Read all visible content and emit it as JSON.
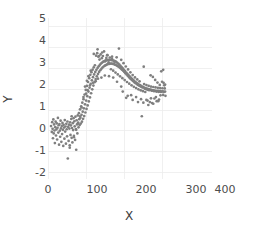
{
  "chart_data": {
    "type": "scatter",
    "title": "",
    "xlabel": "X",
    "ylabel": "Y",
    "xlim": [
      0,
      430
    ],
    "ylim": [
      -2.3,
      5.4
    ],
    "xticks": [
      0,
      100,
      200,
      300,
      400
    ],
    "xticklabels": [
      "0",
      "100",
      "200",
      "300",
      "400"
    ],
    "yticks": [
      -2,
      -1,
      0,
      1,
      2,
      3,
      4,
      5
    ],
    "yticklabels": [
      "-2",
      "-1",
      "0",
      "1",
      "2",
      "3",
      "4",
      "5"
    ],
    "grid": true,
    "grid_color": "#ececec",
    "legend": null,
    "marker_color": "#7f7f7f",
    "marker_size": 2.0,
    "series_name": "observations",
    "points": [
      [
        8,
        0.23
      ],
      [
        10,
        -0.05
      ],
      [
        11,
        0.42
      ],
      [
        12,
        0.1
      ],
      [
        13,
        -0.35
      ],
      [
        14,
        0.55
      ],
      [
        15,
        -0.12
      ],
      [
        16,
        0.31
      ],
      [
        17,
        0.02
      ],
      [
        18,
        -0.58
      ],
      [
        19,
        0.18
      ],
      [
        20,
        0.44
      ],
      [
        21,
        -0.22
      ],
      [
        22,
        0.07
      ],
      [
        23,
        0.36
      ],
      [
        24,
        -0.41
      ],
      [
        25,
        0.15
      ],
      [
        26,
        0.62
      ],
      [
        27,
        -0.08
      ],
      [
        28,
        0.27
      ],
      [
        29,
        -0.66
      ],
      [
        30,
        0.33
      ],
      [
        31,
        0.01
      ],
      [
        32,
        -0.28
      ],
      [
        33,
        0.49
      ],
      [
        34,
        0.12
      ],
      [
        35,
        -0.52
      ],
      [
        36,
        0.24
      ],
      [
        37,
        -0.15
      ],
      [
        38,
        0.38
      ],
      [
        39,
        0.05
      ],
      [
        40,
        -0.72
      ],
      [
        41,
        0.29
      ],
      [
        42,
        0.16
      ],
      [
        43,
        -0.37
      ],
      [
        44,
        0.52
      ],
      [
        45,
        -0.03
      ],
      [
        46,
        0.21
      ],
      [
        47,
        -0.61
      ],
      [
        48,
        0.34
      ],
      [
        49,
        0.08
      ],
      [
        50,
        -0.26
      ],
      [
        51,
        0.45
      ],
      [
        52,
        -1.32
      ],
      [
        53,
        0.19
      ],
      [
        54,
        -0.48
      ],
      [
        55,
        0.3
      ],
      [
        56,
        0.11
      ],
      [
        57,
        -0.69
      ],
      [
        58,
        0.41
      ],
      [
        59,
        -0.19
      ],
      [
        60,
        0.26
      ],
      [
        61,
        0.57
      ],
      [
        62,
        -0.33
      ],
      [
        63,
        0.14
      ],
      [
        64,
        -0.55
      ],
      [
        65,
        0.37
      ],
      [
        66,
        0.04
      ],
      [
        67,
        0.61
      ],
      [
        68,
        -0.24
      ],
      [
        69,
        0.46
      ],
      [
        70,
        0.22
      ],
      [
        71,
        -0.43
      ],
      [
        72,
        0.68
      ],
      [
        73,
        0.09
      ],
      [
        74,
        -0.9
      ],
      [
        75,
        0.51
      ],
      [
        76,
        0.31
      ],
      [
        77,
        -0.12
      ],
      [
        78,
        0.74
      ],
      [
        79,
        0.4
      ],
      [
        80,
        0.17
      ],
      [
        81,
        0.85
      ],
      [
        82,
        0.56
      ],
      [
        83,
        0.28
      ],
      [
        84,
        1.03
      ],
      [
        85,
        0.63
      ],
      [
        86,
        0.35
      ],
      [
        87,
        1.18
      ],
      [
        88,
        0.77
      ],
      [
        89,
        0.44
      ],
      [
        90,
        1.35
      ],
      [
        91,
        0.92
      ],
      [
        92,
        0.58
      ],
      [
        93,
        1.52
      ],
      [
        94,
        1.08
      ],
      [
        95,
        0.71
      ],
      [
        96,
        1.74
      ],
      [
        97,
        1.27
      ],
      [
        98,
        0.88
      ],
      [
        99,
        1.96
      ],
      [
        100,
        1.45
      ],
      [
        101,
        1.05
      ],
      [
        102,
        2.15
      ],
      [
        103,
        1.66
      ],
      [
        104,
        1.22
      ],
      [
        105,
        2.34
      ],
      [
        106,
        1.88
      ],
      [
        107,
        1.41
      ],
      [
        108,
        2.52
      ],
      [
        109,
        2.07
      ],
      [
        110,
        1.6
      ],
      [
        111,
        2.68
      ],
      [
        112,
        2.25
      ],
      [
        113,
        1.8
      ],
      [
        114,
        2.81
      ],
      [
        115,
        2.42
      ],
      [
        116,
        1.99
      ],
      [
        117,
        2.93
      ],
      [
        118,
        2.57
      ],
      [
        119,
        2.17
      ],
      [
        120,
        3.04
      ],
      [
        121,
        2.7
      ],
      [
        122,
        2.33
      ],
      [
        123,
        3.14
      ],
      [
        124,
        2.82
      ],
      [
        125,
        2.48
      ],
      [
        126,
        3.6
      ],
      [
        127,
        2.92
      ],
      [
        128,
        2.61
      ],
      [
        129,
        3.72
      ],
      [
        130,
        3.01
      ],
      [
        131,
        2.72
      ],
      [
        132,
        3.55
      ],
      [
        133,
        3.09
      ],
      [
        134,
        2.82
      ],
      [
        135,
        3.41
      ],
      [
        136,
        3.16
      ],
      [
        137,
        2.9
      ],
      [
        138,
        3.66
      ],
      [
        139,
        3.22
      ],
      [
        140,
        2.97
      ],
      [
        141,
        3.48
      ],
      [
        142,
        3.27
      ],
      [
        143,
        3.03
      ],
      [
        144,
        3.58
      ],
      [
        145,
        3.31
      ],
      [
        146,
        3.08
      ],
      [
        147,
        3.8
      ],
      [
        148,
        3.34
      ],
      [
        149,
        3.12
      ],
      [
        150,
        3.33
      ],
      [
        151,
        3.37
      ],
      [
        152,
        3.15
      ],
      [
        153,
        3.49
      ],
      [
        154,
        3.38
      ],
      [
        155,
        3.18
      ],
      [
        156,
        3.62
      ],
      [
        157,
        3.39
      ],
      [
        158,
        3.2
      ],
      [
        159,
        3.28
      ],
      [
        160,
        3.4
      ],
      [
        161,
        3.21
      ],
      [
        162,
        3.51
      ],
      [
        163,
        3.4
      ],
      [
        164,
        3.22
      ],
      [
        165,
        2.95
      ],
      [
        166,
        3.39
      ],
      [
        167,
        3.22
      ],
      [
        168,
        3.44
      ],
      [
        169,
        3.38
      ],
      [
        170,
        3.21
      ],
      [
        171,
        2.88
      ],
      [
        172,
        3.36
      ],
      [
        173,
        3.19
      ],
      [
        174,
        3.31
      ],
      [
        175,
        3.34
      ],
      [
        176,
        3.17
      ],
      [
        177,
        2.79
      ],
      [
        178,
        3.31
      ],
      [
        179,
        3.14
      ],
      [
        180,
        3.52
      ],
      [
        181,
        3.27
      ],
      [
        182,
        3.11
      ],
      [
        183,
        2.7
      ],
      [
        184,
        3.22
      ],
      [
        185,
        3.07
      ],
      [
        186,
        3.94
      ],
      [
        187,
        3.17
      ],
      [
        188,
        3.03
      ],
      [
        189,
        2.61
      ],
      [
        190,
        3.11
      ],
      [
        191,
        2.98
      ],
      [
        192,
        3.4
      ],
      [
        193,
        3.05
      ],
      [
        194,
        2.93
      ],
      [
        195,
        2.52
      ],
      [
        196,
        2.99
      ],
      [
        197,
        2.88
      ],
      [
        198,
        3.24
      ],
      [
        199,
        2.92
      ],
      [
        200,
        2.82
      ],
      [
        201,
        2.43
      ],
      [
        202,
        2.86
      ],
      [
        203,
        2.76
      ],
      [
        204,
        3.08
      ],
      [
        205,
        2.79
      ],
      [
        206,
        2.7
      ],
      [
        207,
        2.34
      ],
      [
        208,
        2.73
      ],
      [
        209,
        2.64
      ],
      [
        210,
        2.94
      ],
      [
        211,
        2.67
      ],
      [
        212,
        2.58
      ],
      [
        213,
        2.26
      ],
      [
        214,
        2.61
      ],
      [
        215,
        2.52
      ],
      [
        216,
        2.8
      ],
      [
        217,
        2.55
      ],
      [
        218,
        2.47
      ],
      [
        219,
        2.18
      ],
      [
        220,
        2.49
      ],
      [
        221,
        2.42
      ],
      [
        222,
        2.67
      ],
      [
        223,
        2.44
      ],
      [
        224,
        2.37
      ],
      [
        225,
        2.11
      ],
      [
        226,
        2.39
      ],
      [
        227,
        2.32
      ],
      [
        228,
        2.56
      ],
      [
        229,
        2.34
      ],
      [
        230,
        2.28
      ],
      [
        231,
        2.05
      ],
      [
        232,
        2.3
      ],
      [
        233,
        2.24
      ],
      [
        234,
        2.46
      ],
      [
        235,
        2.26
      ],
      [
        236,
        2.2
      ],
      [
        237,
        1.99
      ],
      [
        238,
        2.22
      ],
      [
        239,
        2.17
      ],
      [
        240,
        2.37
      ],
      [
        241,
        2.19
      ],
      [
        242,
        2.14
      ],
      [
        243,
        1.94
      ],
      [
        244,
        2.15
      ],
      [
        245,
        2.1
      ],
      [
        246,
        0.7
      ],
      [
        247,
        2.12
      ],
      [
        248,
        2.08
      ],
      [
        249,
        1.9
      ],
      [
        250,
        2.09
      ],
      [
        251,
        3.07
      ],
      [
        252,
        2.24
      ],
      [
        253,
        2.06
      ],
      [
        254,
        2.02
      ],
      [
        255,
        1.86
      ],
      [
        256,
        2.04
      ],
      [
        257,
        2.0
      ],
      [
        258,
        2.19
      ],
      [
        259,
        2.02
      ],
      [
        260,
        1.98
      ],
      [
        261,
        1.45
      ],
      [
        262,
        2.0
      ],
      [
        263,
        1.96
      ],
      [
        264,
        2.15
      ],
      [
        265,
        1.99
      ],
      [
        266,
        1.95
      ],
      [
        267,
        1.38
      ],
      [
        268,
        1.97
      ],
      [
        269,
        2.66
      ],
      [
        270,
        2.12
      ],
      [
        271,
        1.96
      ],
      [
        272,
        1.92
      ],
      [
        273,
        1.33
      ],
      [
        274,
        1.94
      ],
      [
        275,
        2.58
      ],
      [
        276,
        2.1
      ],
      [
        277,
        1.94
      ],
      [
        278,
        1.9
      ],
      [
        279,
        1.55
      ],
      [
        280,
        1.92
      ],
      [
        281,
        2.44
      ],
      [
        282,
        2.08
      ],
      [
        283,
        1.92
      ],
      [
        284,
        1.88
      ],
      [
        285,
        1.42
      ],
      [
        286,
        1.9
      ],
      [
        287,
        2.31
      ],
      [
        288,
        2.06
      ],
      [
        289,
        1.91
      ],
      [
        290,
        1.87
      ],
      [
        291,
        1.5
      ],
      [
        292,
        1.89
      ],
      [
        293,
        2.2
      ],
      [
        294,
        2.05
      ],
      [
        295,
        1.9
      ],
      [
        296,
        1.86
      ],
      [
        297,
        2.85
      ],
      [
        298,
        1.88
      ],
      [
        299,
        2.35
      ],
      [
        300,
        2.04
      ],
      [
        301,
        1.89
      ],
      [
        302,
        1.72
      ],
      [
        303,
        2.3
      ],
      [
        304,
        1.87
      ],
      [
        305,
        2.18
      ],
      [
        306,
        2.03
      ],
      [
        307,
        1.88
      ],
      [
        308,
        1.68
      ],
      [
        130,
        3.9
      ],
      [
        142,
        3.75
      ],
      [
        155,
        3.62
      ],
      [
        168,
        3.55
      ],
      [
        120,
        3.68
      ],
      [
        134,
        3.58
      ],
      [
        112,
        2.88
      ],
      [
        106,
        2.62
      ],
      [
        102,
        2.4
      ],
      [
        97,
        2.12
      ],
      [
        93,
        1.62
      ],
      [
        88,
        1.12
      ],
      [
        84,
        0.7
      ],
      [
        79,
        0.35
      ],
      [
        74,
        0.05
      ],
      [
        68,
        -0.3
      ],
      [
        62,
        0.7
      ],
      [
        57,
        -0.8
      ],
      [
        250,
        1.35
      ],
      [
        263,
        1.24
      ],
      [
        276,
        1.3
      ],
      [
        289,
        1.42
      ],
      [
        244,
        1.52
      ],
      [
        231,
        1.62
      ],
      [
        218,
        1.71
      ],
      [
        205,
        1.58
      ],
      [
        192,
        2.12
      ],
      [
        181,
        2.35
      ],
      [
        171,
        2.55
      ],
      [
        160,
        2.62
      ],
      [
        196,
        1.88
      ],
      [
        209,
        1.68
      ],
      [
        222,
        1.48
      ],
      [
        236,
        1.38
      ],
      [
        258,
        1.48
      ],
      [
        270,
        1.56
      ],
      [
        283,
        1.62
      ],
      [
        295,
        1.7
      ],
      [
        302,
        2.92
      ],
      [
        307,
        2.22
      ],
      [
        149,
        2.65
      ],
      [
        140,
        2.55
      ],
      [
        131,
        2.5
      ],
      [
        125,
        2.38
      ],
      [
        118,
        2.3
      ],
      [
        110,
        2.18
      ],
      [
        104,
        1.95
      ],
      [
        100,
        1.78
      ]
    ]
  }
}
